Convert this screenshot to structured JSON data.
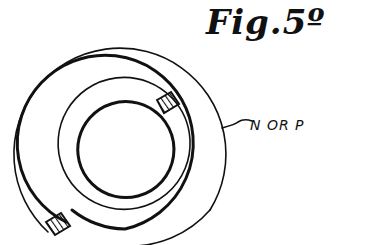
{
  "figure": {
    "title": "Fig.5º",
    "label": "N OR P",
    "colors": {
      "ink": "#111111",
      "background": "#ffffff"
    }
  }
}
